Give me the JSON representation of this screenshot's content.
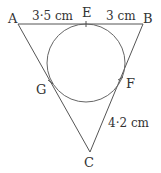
{
  "diagram": {
    "type": "triangle-with-incircle",
    "points": {
      "A": "A",
      "B": "B",
      "C": "C",
      "E": "E",
      "F": "F",
      "G": "G"
    },
    "measurements": {
      "AE": "3·5 cm",
      "EB": "3 cm",
      "FC": "4·2 cm"
    },
    "colors": {
      "line": "#555555",
      "text": "#333333"
    }
  }
}
